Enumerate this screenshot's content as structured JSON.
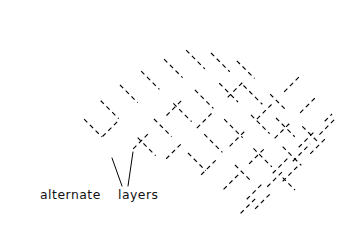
{
  "figure": {
    "kind": "technical-line-drawing",
    "background_color": "#ffffff",
    "ink_color": "#000000",
    "width": 352,
    "height": 243
  },
  "annotation": {
    "label_alternate": "alternate",
    "label_layers": "layers",
    "full_text": "alternate layers",
    "leaders": [
      {
        "name": "leader-left",
        "x1": 122,
        "y1": 186,
        "x2": 112,
        "y2": 158
      },
      {
        "name": "leader-right",
        "x1": 128,
        "y1": 186,
        "x2": 133,
        "y2": 152
      }
    ],
    "text_x": 40,
    "text_y": 199
  },
  "top_clipped_text": {
    "value": "",
    "x": 262,
    "y": 5
  },
  "geometry": {
    "rod_width": 11.4,
    "angle_a_deg": -45,
    "angle_b_deg": 45,
    "pitch": 20.0,
    "stroke_width": 2.1,
    "hidden_stroke_width": 1.15,
    "hidden_dash": "4.5 3.6"
  },
  "chart_data": {
    "type": "diagram",
    "layer_directions_deg": [
      -45,
      45
    ],
    "rods_direction_a": 9,
    "rods_direction_b": 9,
    "annotations": [
      "alternate",
      "layers"
    ]
  },
  "rods_a": [
    {
      "name": "rod-a-1",
      "x1": 16,
      "y1": 86,
      "x2": 100,
      "y2": 170,
      "solid_spans": [
        [
          0.0,
          1.0
        ]
      ],
      "hidden_spans": []
    },
    {
      "name": "rod-a-2",
      "x1": 41,
      "y1": 76,
      "x2": 139,
      "y2": 174,
      "solid_spans": [
        [
          0.0,
          0.46
        ],
        [
          0.6,
          1.0
        ]
      ],
      "hidden_spans": [
        [
          0.44,
          0.62
        ]
      ]
    },
    {
      "name": "rod-a-3",
      "x1": 66,
      "y1": 66,
      "x2": 178,
      "y2": 178,
      "solid_spans": [
        [
          0.0,
          0.33
        ],
        [
          0.45,
          0.66
        ],
        [
          0.78,
          1.0
        ]
      ],
      "hidden_spans": [
        [
          0.31,
          0.47
        ],
        [
          0.64,
          0.8
        ]
      ]
    },
    {
      "name": "rod-a-4",
      "x1": 91,
      "y1": 56,
      "x2": 217,
      "y2": 182,
      "solid_spans": [
        [
          0.0,
          0.25
        ],
        [
          0.35,
          0.52
        ],
        [
          0.62,
          0.79
        ],
        [
          0.89,
          1.0
        ]
      ],
      "hidden_spans": [
        [
          0.23,
          0.37
        ],
        [
          0.5,
          0.64
        ],
        [
          0.77,
          0.91
        ]
      ]
    },
    {
      "name": "rod-a-5",
      "x1": 116,
      "y1": 46,
      "x2": 256,
      "y2": 186,
      "solid_spans": [
        [
          0.0,
          0.2
        ],
        [
          0.29,
          0.43
        ],
        [
          0.52,
          0.65
        ],
        [
          0.74,
          0.87
        ],
        [
          0.95,
          1.0
        ]
      ],
      "hidden_spans": [
        [
          0.18,
          0.31
        ],
        [
          0.41,
          0.54
        ],
        [
          0.63,
          0.76
        ],
        [
          0.85,
          0.97
        ]
      ]
    },
    {
      "name": "rod-a-6",
      "x1": 141,
      "y1": 36,
      "x2": 295,
      "y2": 190,
      "solid_spans": [
        [
          0.0,
          0.17
        ],
        [
          0.25,
          0.37
        ],
        [
          0.45,
          0.56
        ],
        [
          0.64,
          0.75
        ],
        [
          0.83,
          0.94
        ]
      ],
      "hidden_spans": [
        [
          0.15,
          0.27
        ],
        [
          0.35,
          0.47
        ],
        [
          0.54,
          0.66
        ],
        [
          0.73,
          0.85
        ],
        [
          0.92,
          1.0
        ]
      ]
    },
    {
      "name": "rod-a-7",
      "x1": 166,
      "y1": 30,
      "x2": 310,
      "y2": 174,
      "solid_spans": [
        [
          0.0,
          0.16
        ],
        [
          0.25,
          0.39
        ],
        [
          0.48,
          0.61
        ],
        [
          0.7,
          0.83
        ],
        [
          0.92,
          1.0
        ]
      ],
      "hidden_spans": [
        [
          0.14,
          0.27
        ],
        [
          0.37,
          0.5
        ],
        [
          0.59,
          0.72
        ],
        [
          0.81,
          0.94
        ]
      ]
    },
    {
      "name": "rod-a-8",
      "x1": 191,
      "y1": 33,
      "x2": 316,
      "y2": 158,
      "solid_spans": [
        [
          0.0,
          0.18
        ],
        [
          0.29,
          0.44
        ],
        [
          0.55,
          0.7
        ],
        [
          0.81,
          1.0
        ]
      ],
      "hidden_spans": [
        [
          0.16,
          0.31
        ],
        [
          0.42,
          0.57
        ],
        [
          0.68,
          0.83
        ]
      ]
    },
    {
      "name": "rod-a-9",
      "x1": 216,
      "y1": 40,
      "x2": 320,
      "y2": 144,
      "solid_spans": [
        [
          0.0,
          0.22
        ],
        [
          0.35,
          0.54
        ],
        [
          0.66,
          0.85
        ],
        [
          0.96,
          1.0
        ]
      ],
      "hidden_spans": [
        [
          0.2,
          0.37
        ],
        [
          0.52,
          0.68
        ],
        [
          0.83,
          0.98
        ]
      ]
    }
  ],
  "rods_b": [
    {
      "name": "rod-b-1",
      "x1": 24,
      "y1": 168,
      "x2": 108,
      "y2": 84,
      "solid_spans": [
        [
          0.0,
          1.0
        ]
      ],
      "hidden_spans": []
    },
    {
      "name": "rod-b-2",
      "x1": 63,
      "y1": 176,
      "x2": 157,
      "y2": 82,
      "solid_spans": [
        [
          0.0,
          0.44
        ],
        [
          0.58,
          1.0
        ]
      ],
      "hidden_spans": [
        [
          0.42,
          0.6
        ]
      ]
    },
    {
      "name": "rod-b-3",
      "x1": 102,
      "y1": 180,
      "x2": 206,
      "y2": 76,
      "solid_spans": [
        [
          0.0,
          0.32
        ],
        [
          0.44,
          0.64
        ],
        [
          0.76,
          1.0
        ]
      ],
      "hidden_spans": [
        [
          0.3,
          0.46
        ],
        [
          0.62,
          0.78
        ]
      ]
    },
    {
      "name": "rod-b-4",
      "x1": 141,
      "y1": 184,
      "x2": 255,
      "y2": 70,
      "solid_spans": [
        [
          0.0,
          0.24
        ],
        [
          0.34,
          0.51
        ],
        [
          0.61,
          0.78
        ],
        [
          0.88,
          1.0
        ]
      ],
      "hidden_spans": [
        [
          0.22,
          0.36
        ],
        [
          0.49,
          0.63
        ],
        [
          0.76,
          0.9
        ]
      ]
    },
    {
      "name": "rod-b-5",
      "x1": 180,
      "y1": 196,
      "x2": 304,
      "y2": 72,
      "solid_spans": [
        [
          0.0,
          0.19
        ],
        [
          0.28,
          0.42
        ],
        [
          0.51,
          0.64
        ],
        [
          0.73,
          0.86
        ],
        [
          0.94,
          1.0
        ]
      ],
      "hidden_spans": [
        [
          0.17,
          0.3
        ],
        [
          0.4,
          0.53
        ],
        [
          0.62,
          0.75
        ],
        [
          0.84,
          0.96
        ]
      ]
    },
    {
      "name": "rod-b-6",
      "x1": 205,
      "y1": 208,
      "x2": 321,
      "y2": 92,
      "solid_spans": [
        [
          0.0,
          0.18
        ],
        [
          0.27,
          0.4
        ],
        [
          0.5,
          0.62
        ],
        [
          0.72,
          0.84
        ],
        [
          0.93,
          1.0
        ]
      ],
      "hidden_spans": [
        [
          0.16,
          0.29
        ],
        [
          0.38,
          0.52
        ],
        [
          0.6,
          0.74
        ],
        [
          0.82,
          0.95
        ]
      ]
    },
    {
      "name": "rod-b-7",
      "x1": 228,
      "y1": 218,
      "x2": 332,
      "y2": 114,
      "solid_spans": [
        [
          0.0,
          0.2
        ],
        [
          0.31,
          0.45
        ],
        [
          0.56,
          0.7
        ],
        [
          0.81,
          0.95
        ]
      ],
      "hidden_spans": [
        [
          0.18,
          0.33
        ],
        [
          0.43,
          0.58
        ],
        [
          0.68,
          0.83
        ],
        [
          0.93,
          1.0
        ]
      ]
    },
    {
      "name": "rod-b-8",
      "x1": 222,
      "y1": 232,
      "x2": 338,
      "y2": 116,
      "solid_spans": [
        [
          0.0,
          0.18
        ],
        [
          0.28,
          0.41
        ],
        [
          0.51,
          0.63
        ],
        [
          0.74,
          0.86
        ],
        [
          0.96,
          1.0
        ]
      ],
      "hidden_spans": [
        [
          0.16,
          0.3
        ],
        [
          0.39,
          0.53
        ],
        [
          0.61,
          0.76
        ],
        [
          0.84,
          0.98
        ]
      ]
    },
    {
      "name": "rod-b-9",
      "x1": 236,
      "y1": 228,
      "x2": 342,
      "y2": 122,
      "solid_spans": [
        [
          0.0,
          0.2
        ],
        [
          0.32,
          0.46
        ],
        [
          0.58,
          0.72
        ],
        [
          0.84,
          1.0
        ]
      ],
      "hidden_spans": [
        [
          0.18,
          0.34
        ],
        [
          0.44,
          0.6
        ],
        [
          0.7,
          0.86
        ]
      ]
    }
  ]
}
